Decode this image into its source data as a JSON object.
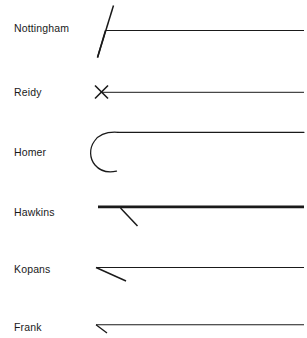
{
  "canvas": {
    "width": 307,
    "height": 338,
    "background": "#ffffff",
    "stroke_color": "#1a1a1a",
    "line_right_edge": 304
  },
  "rows": [
    {
      "label": "Nottingham",
      "label_x": 14,
      "label_y": 22,
      "line_y": 30,
      "line_start_x": 105,
      "line_width": 1.1,
      "mark": "narrow-vee-check",
      "mark_desc": "two near-parallel strokes converging to a point at lower left, opening upward to the right"
    },
    {
      "label": "Reidy",
      "label_x": 14,
      "label_y": 86,
      "line_y": 92,
      "line_start_x": 102,
      "line_width": 1.0,
      "mark": "x-cross",
      "mark_desc": "small X crossing mark at the left end of the line"
    },
    {
      "label": "Homer",
      "label_x": 14,
      "label_y": 146,
      "line_y": 132,
      "line_start_x": 118,
      "line_width": 1.1,
      "mark": "c-curve",
      "mark_desc": "large C shape open to the right, upper arm merging into the horizontal line"
    },
    {
      "label": "Hawkins",
      "label_x": 14,
      "label_y": 206,
      "line_y": 207,
      "line_start_x": 98,
      "line_width": 2.6,
      "mark": "thick-line-with-descender",
      "mark_desc": "heavy horizontal line with a thin diagonal descending to the right"
    },
    {
      "label": "Kopans",
      "label_x": 14,
      "label_y": 263,
      "line_y": 268,
      "line_start_x": 96,
      "line_width": 1.0,
      "mark": "narrow-wedge",
      "mark_desc": "sharp wedge with apex at left, lower edge descending to the right"
    },
    {
      "label": "Frank",
      "label_x": 14,
      "label_y": 321,
      "line_y": 325,
      "line_start_x": 96,
      "line_width": 1.0,
      "mark": "small-wedge",
      "mark_desc": "small wedge tick at the left end of the line, row clipped by bottom edge"
    }
  ]
}
